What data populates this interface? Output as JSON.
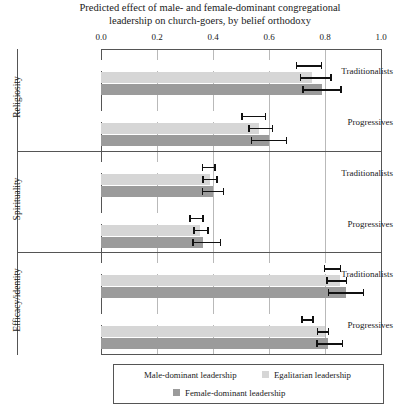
{
  "chart_data": {
    "type": "bar",
    "orientation": "horizontal",
    "title": "Predicted effect of male- and female-dominant congregational leadership on church-goers, by belief orthodoxy",
    "title_lines": [
      "Predicted effect of male- and female-dominant congregational",
      "leadership on church-goers, by belief orthodoxy"
    ],
    "xlabel": "",
    "ylabel": "",
    "xlim": [
      0.0,
      1.0
    ],
    "xticks": [
      0.0,
      0.2,
      0.4,
      0.6,
      0.8,
      1.0
    ],
    "xtick_labels": [
      "0.0",
      "0.2",
      "0.4",
      "0.6",
      "0.8",
      "1.0"
    ],
    "grid": true,
    "legend_position": "bottom",
    "series": [
      {
        "name": "Male-dominant leadership",
        "color": "#ffffff",
        "key": "male"
      },
      {
        "name": "Egalitarian leadership",
        "color": "#d6d6d6",
        "key": "egal"
      },
      {
        "name": "Female-dominant leadership",
        "color": "#9b9b9b",
        "key": "female"
      }
    ],
    "panels": [
      {
        "group": "Religiosity",
        "categories": [
          "Traditionalists",
          "Progressives"
        ],
        "rows": [
          {
            "category": "Traditionalists",
            "bars": [
              {
                "series": "Male-dominant leadership",
                "value": 0.735,
                "ci_low": 0.695,
                "ci_high": 0.79
              },
              {
                "series": "Egalitarian leadership",
                "value": 0.755,
                "ci_low": 0.71,
                "ci_high": 0.825
              },
              {
                "series": "Female-dominant leadership",
                "value": 0.79,
                "ci_low": 0.718,
                "ci_high": 0.86
              }
            ]
          },
          {
            "category": "Progressives",
            "bars": [
              {
                "series": "Male-dominant leadership",
                "value": 0.545,
                "ci_low": 0.5,
                "ci_high": 0.59
              },
              {
                "series": "Egalitarian leadership",
                "value": 0.565,
                "ci_low": 0.525,
                "ci_high": 0.615
              },
              {
                "series": "Female-dominant leadership",
                "value": 0.6,
                "ci_low": 0.535,
                "ci_high": 0.665
              }
            ]
          }
        ]
      },
      {
        "group": "Spirituality",
        "categories": [
          "Traditionalists",
          "Progressives"
        ],
        "rows": [
          {
            "category": "Traditionalists",
            "bars": [
              {
                "series": "Male-dominant leadership",
                "value": 0.385,
                "ci_low": 0.36,
                "ci_high": 0.41
              },
              {
                "series": "Egalitarian leadership",
                "value": 0.39,
                "ci_low": 0.362,
                "ci_high": 0.418
              },
              {
                "series": "Female-dominant leadership",
                "value": 0.4,
                "ci_low": 0.36,
                "ci_high": 0.44
              }
            ]
          },
          {
            "category": "Progressives",
            "bars": [
              {
                "series": "Male-dominant leadership",
                "value": 0.35,
                "ci_low": 0.315,
                "ci_high": 0.368
              },
              {
                "series": "Egalitarian leadership",
                "value": 0.355,
                "ci_low": 0.33,
                "ci_high": 0.385
              },
              {
                "series": "Female-dominant leadership",
                "value": 0.365,
                "ci_low": 0.325,
                "ci_high": 0.43
              }
            ]
          }
        ]
      },
      {
        "group": "Efficacy/identity",
        "categories": [
          "Traditionalists",
          "Progressives"
        ],
        "rows": [
          {
            "category": "Traditionalists",
            "bars": [
              {
                "series": "Male-dominant leadership",
                "value": 0.84,
                "ci_low": 0.795,
                "ci_high": 0.858
              },
              {
                "series": "Egalitarian leadership",
                "value": 0.855,
                "ci_low": 0.805,
                "ci_high": 0.88
              },
              {
                "series": "Female-dominant leadership",
                "value": 0.875,
                "ci_low": 0.81,
                "ci_high": 0.94
              }
            ]
          },
          {
            "category": "Progressives",
            "bars": [
              {
                "series": "Male-dominant leadership",
                "value": 0.78,
                "ci_low": 0.715,
                "ci_high": 0.76
              },
              {
                "series": "Egalitarian leadership",
                "value": 0.8,
                "ci_low": 0.77,
                "ci_high": 0.815
              },
              {
                "series": "Female-dominant leadership",
                "value": 0.81,
                "ci_low": 0.768,
                "ci_high": 0.865
              }
            ]
          }
        ]
      }
    ]
  }
}
